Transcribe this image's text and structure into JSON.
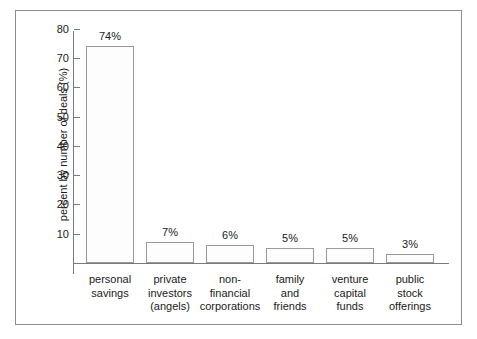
{
  "chart_data": {
    "type": "bar",
    "title": "",
    "subtitle": "",
    "xlabel": "",
    "ylabel": "percent by number of deals (%)",
    "ylim": [
      0,
      85
    ],
    "yticks": [
      10,
      20,
      30,
      40,
      50,
      60,
      70,
      80
    ],
    "ytick_labels": [
      "10",
      "20",
      "30",
      "40",
      "50",
      "60",
      "70",
      "80"
    ],
    "grid": false,
    "legend": "none",
    "categories": [
      "personal savings",
      "private investors (angels)",
      "non-financial corporations",
      "family and friends",
      "venture capital funds",
      "public stock offerings"
    ],
    "category_lines": [
      [
        "personal",
        "savings"
      ],
      [
        "private",
        "investors",
        "(angels)"
      ],
      [
        "non-",
        "financial",
        "corporations"
      ],
      [
        "family",
        "and",
        "friends"
      ],
      [
        "venture",
        "capital",
        "funds"
      ],
      [
        "public",
        "stock",
        "offerings"
      ]
    ],
    "values": [
      74,
      7,
      6,
      5,
      5,
      3
    ],
    "data_labels": [
      "74%",
      "7%",
      "6%",
      "5%",
      "5%",
      "3%"
    ],
    "colors": {
      "bar_fill": "#fdfdfd",
      "bar_stroke": "#9a9a9a",
      "axis": "#7a7a7a",
      "frame": "#8c8c8c",
      "text": "#1a1a1a"
    }
  }
}
